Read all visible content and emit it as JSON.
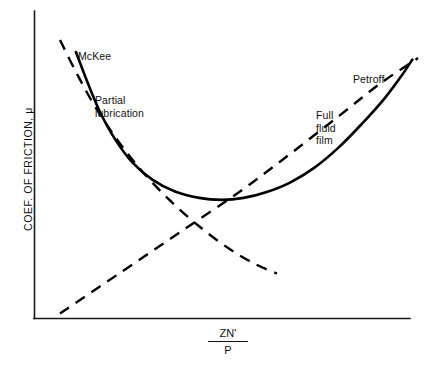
{
  "chart_data": {
    "type": "line",
    "title": "",
    "subtitle": "",
    "xlabel_numerator": "ZN'",
    "xlabel_denominator": "P",
    "ylabel": "COEF. OF FRICTION, μ",
    "grid": false,
    "legend_position": "inline-annotations",
    "axes": {
      "x_axis_visible": true,
      "y_axis_visible": true,
      "x_ticks": [],
      "y_ticks": [],
      "xlim": [
        0,
        1
      ],
      "ylim": [
        0,
        1
      ]
    },
    "series": [
      {
        "name": "McKee",
        "style": "solid",
        "color": "#000000",
        "description": "Measured coefficient of friction; falls steeply through partial lubrication, reaches a minimum, then rises with full fluid film",
        "points": [
          [
            0.078,
            0.957
          ],
          [
            0.11,
            0.845
          ],
          [
            0.145,
            0.735
          ],
          [
            0.185,
            0.64
          ],
          [
            0.23,
            0.56
          ],
          [
            0.285,
            0.497
          ],
          [
            0.345,
            0.455
          ],
          [
            0.41,
            0.432
          ],
          [
            0.47,
            0.425
          ],
          [
            0.53,
            0.432
          ],
          [
            0.59,
            0.452
          ],
          [
            0.655,
            0.487
          ],
          [
            0.72,
            0.54
          ],
          [
            0.785,
            0.612
          ],
          [
            0.85,
            0.7
          ],
          [
            0.91,
            0.79
          ],
          [
            0.955,
            0.87
          ],
          [
            0.985,
            0.93
          ]
        ]
      },
      {
        "name": "Partial lubrication",
        "style": "dashed",
        "color": "#000000",
        "description": "Descending dashed asymptote of the boundary / partial lubrication regime",
        "points": [
          [
            0.035,
            1.0
          ],
          [
            0.08,
            0.88
          ],
          [
            0.13,
            0.76
          ],
          [
            0.19,
            0.64
          ],
          [
            0.255,
            0.53
          ],
          [
            0.33,
            0.425
          ],
          [
            0.41,
            0.33
          ],
          [
            0.49,
            0.25
          ],
          [
            0.56,
            0.195
          ],
          [
            0.62,
            0.16
          ]
        ]
      },
      {
        "name": "Petroff",
        "style": "dashed",
        "color": "#000000",
        "description": "Rising dashed Petroff line for full fluid film friction",
        "points": [
          [
            0.035,
            0.016
          ],
          [
            0.2,
            0.165
          ],
          [
            0.36,
            0.31
          ],
          [
            0.52,
            0.455
          ],
          [
            0.66,
            0.595
          ],
          [
            0.79,
            0.73
          ],
          [
            0.9,
            0.845
          ],
          [
            1.0,
            0.935
          ]
        ]
      }
    ],
    "annotations": [
      {
        "id": "mckee",
        "text": "McKee",
        "x": 0.12,
        "y": 0.9
      },
      {
        "id": "partial-lubrication",
        "text": "Partial\nlubrication",
        "x": 0.2,
        "y": 0.75
      },
      {
        "id": "petroff",
        "text": "Petroff",
        "x": 0.87,
        "y": 0.82
      },
      {
        "id": "full-fluid-film",
        "text": "Full\nfluid\nfilm",
        "x": 0.76,
        "y": 0.68
      }
    ]
  },
  "labels": {
    "mckee": "McKee",
    "partial_lubrication": "Partial\nlubrication",
    "petroff": "Petroff",
    "full_fluid_film": "Full\nfluid\nfilm",
    "y_axis": "COEF. OF FRICTION, μ",
    "x_axis_numerator": "ZN'",
    "x_axis_denominator": "P"
  },
  "colors": {
    "background": "#ffffff",
    "ink": "#000000",
    "axis": "#1a1a1a"
  }
}
